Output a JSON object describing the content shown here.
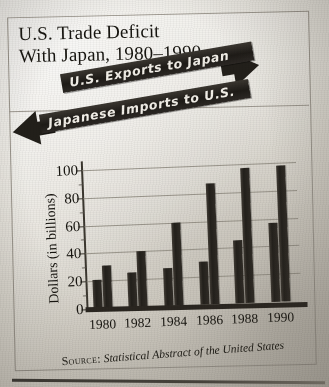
{
  "figure": {
    "title_line1": "U.S. Trade Deficit",
    "title_line2": "With Japan, 1980–1990",
    "source_label": "Source:",
    "source_text": "Statistical Abstract of the United States",
    "top_crumb": ""
  },
  "banners": [
    {
      "label": "U.S. Exports to Japan",
      "direction": "right",
      "icon": "arrow-right-icon"
    },
    {
      "label": "Japanese Imports to U.S.",
      "direction": "left",
      "icon": "arrow-left-icon"
    }
  ],
  "colors": {
    "bar": "#23201b",
    "banner_fill": "#221f1a",
    "banner_text": "#f2efe8",
    "frame": "#9a958c",
    "grid": "#8e897f",
    "paper": "#e4e1d9",
    "ink": "#16140f"
  },
  "chart_data": {
    "type": "bar",
    "title": "U.S. Trade Deficit With Japan, 1980–1990",
    "xlabel": "",
    "ylabel": "Dollars (in billions)",
    "categories": [
      "1980",
      "1982",
      "1984",
      "1986",
      "1988",
      "1990"
    ],
    "series": [
      {
        "name": "U.S. Exports to Japan",
        "values": [
          21,
          25,
          27,
          31,
          45,
          57
        ]
      },
      {
        "name": "Japanese Imports to U.S.",
        "values": [
          31,
          40,
          60,
          87,
          97,
          98
        ]
      }
    ],
    "yticks": [
      0,
      20,
      40,
      60,
      80,
      100
    ],
    "ylim": [
      0,
      105
    ],
    "grid": true,
    "legend_position": "banners-above-plot",
    "units": "billions of dollars"
  }
}
